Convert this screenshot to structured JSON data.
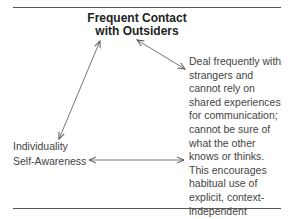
{
  "diagram": {
    "top_node": {
      "line1": "Frequent Contact",
      "line2": "with Outsiders"
    },
    "left_node": {
      "line1": "Individuality",
      "line2": "Self-Awareness"
    },
    "description": {
      "lines": [
        "Deal frequently with",
        "strangers and",
        "cannot rely on",
        "shared experiences",
        "for communication;",
        "cannot be sure of",
        "what the other",
        "knows or thinks.",
        "This encourages",
        "habitual use of",
        "explicit, context-",
        "independent",
        "language."
      ]
    },
    "arrows": [
      {
        "from": "top_node",
        "to": "left_node",
        "type": "bidirectional"
      },
      {
        "from": "top_node",
        "to": "description",
        "type": "bidirectional"
      },
      {
        "from": "left_node",
        "to": "description",
        "type": "bidirectional"
      }
    ]
  }
}
